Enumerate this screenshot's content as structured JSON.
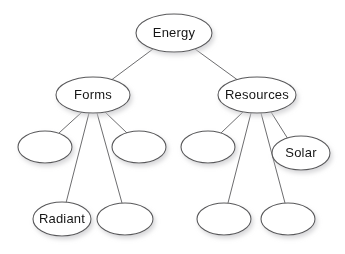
{
  "diagram": {
    "type": "tree",
    "style": {
      "background_color": "#ffffff",
      "node_fill": "#ffffff",
      "node_stroke": "#58585a",
      "edge_stroke": "#6d6d6f",
      "label_color": "#161616",
      "shadow_color": "#b4b4b4"
    },
    "nodes": [
      {
        "id": "energy",
        "label": "Energy",
        "cx": 174,
        "cy": 33,
        "rx": 38,
        "ry": 19,
        "level": 0
      },
      {
        "id": "forms",
        "label": "Forms",
        "cx": 93,
        "cy": 95,
        "rx": 37,
        "ry": 18,
        "level": 1
      },
      {
        "id": "resources",
        "label": "Resources",
        "cx": 257,
        "cy": 95,
        "rx": 39,
        "ry": 18,
        "level": 1
      },
      {
        "id": "forms-c1",
        "label": "",
        "cx": 45,
        "cy": 147,
        "rx": 27,
        "ry": 16,
        "level": 2
      },
      {
        "id": "forms-c2",
        "label": "",
        "cx": 139,
        "cy": 147,
        "rx": 27,
        "ry": 16,
        "level": 2
      },
      {
        "id": "forms-c3",
        "label": "Radiant",
        "cx": 62,
        "cy": 219,
        "rx": 29,
        "ry": 17,
        "level": 3
      },
      {
        "id": "forms-c4",
        "label": "",
        "cx": 125,
        "cy": 219,
        "rx": 28,
        "ry": 16,
        "level": 3
      },
      {
        "id": "res-c1",
        "label": "",
        "cx": 208,
        "cy": 147,
        "rx": 27,
        "ry": 16,
        "level": 2
      },
      {
        "id": "res-c2",
        "label": "Solar",
        "cx": 301,
        "cy": 153,
        "rx": 29,
        "ry": 17,
        "level": 2
      },
      {
        "id": "res-c3",
        "label": "",
        "cx": 224,
        "cy": 219,
        "rx": 27,
        "ry": 16,
        "level": 3
      },
      {
        "id": "res-c4",
        "label": "",
        "cx": 288,
        "cy": 219,
        "rx": 27,
        "ry": 16,
        "level": 3
      }
    ],
    "edges": [
      {
        "id": "e-energy-forms",
        "from": "energy",
        "to": "forms",
        "x1": 153,
        "y1": 49,
        "x2": 110,
        "y2": 81
      },
      {
        "id": "e-energy-resources",
        "from": "energy",
        "to": "resources",
        "x1": 195,
        "y1": 49,
        "x2": 239,
        "y2": 81
      },
      {
        "id": "e-forms-c1",
        "from": "forms",
        "to": "forms-c1",
        "x1": 82,
        "y1": 112,
        "x2": 59,
        "y2": 133
      },
      {
        "id": "e-forms-c3",
        "from": "forms",
        "to": "forms-c3",
        "x1": 89,
        "y1": 113,
        "x2": 66,
        "y2": 203
      },
      {
        "id": "e-forms-c4",
        "from": "forms",
        "to": "forms-c4",
        "x1": 97,
        "y1": 113,
        "x2": 122,
        "y2": 203
      },
      {
        "id": "e-forms-c2",
        "from": "forms",
        "to": "forms-c2",
        "x1": 105,
        "y1": 112,
        "x2": 127,
        "y2": 133
      },
      {
        "id": "e-res-c1",
        "from": "resources",
        "to": "res-c1",
        "x1": 243,
        "y1": 112,
        "x2": 221,
        "y2": 133
      },
      {
        "id": "e-res-c3",
        "from": "resources",
        "to": "res-c3",
        "x1": 251,
        "y1": 113,
        "x2": 228,
        "y2": 203
      },
      {
        "id": "e-res-c4",
        "from": "resources",
        "to": "res-c4",
        "x1": 261,
        "y1": 113,
        "x2": 285,
        "y2": 203
      },
      {
        "id": "e-res-c2",
        "from": "resources",
        "to": "res-c2",
        "x1": 271,
        "y1": 112,
        "x2": 288,
        "y2": 139
      }
    ]
  }
}
